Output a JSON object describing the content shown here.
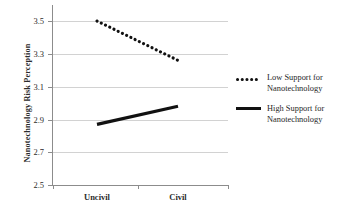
{
  "chart_data": {
    "type": "line",
    "title": "",
    "xlabel": "",
    "ylabel": "Nanotechnology Risk Perception",
    "categories": [
      "Uncivil",
      "Civil"
    ],
    "ylim": [
      2.5,
      3.5
    ],
    "yticks": [
      "3.5",
      "3.3",
      "3.1",
      "2.9",
      "2.7",
      "2.5"
    ],
    "ytick_values": [
      3.5,
      3.3,
      3.1,
      2.9,
      2.7,
      2.5
    ],
    "grid": true,
    "legend_position": "right",
    "series": [
      {
        "name": "Low Support for Nanotechnology",
        "label_line1": "Low Support for",
        "label_line2": "Nanotechnology",
        "style": "dotted",
        "color": "#111111",
        "values": [
          3.5,
          3.26
        ]
      },
      {
        "name": "High Support for Nanotechnology",
        "label_line1": "High Support for",
        "label_line2": "Nanotechnology",
        "style": "solid",
        "color": "#111111",
        "values": [
          2.87,
          2.98
        ]
      }
    ]
  },
  "axis": {
    "y_title": "Nanotechnology Risk Perception",
    "y_labels": [
      "3.5",
      "3.3",
      "3.1",
      "2.9",
      "2.7",
      "2.5"
    ],
    "x_labels": [
      "Uncivil",
      "Civil"
    ]
  },
  "legend": {
    "entries": [
      {
        "line1": "Low Support for",
        "line2": "Nanotechnology",
        "marker": "dotted-line-icon"
      },
      {
        "line1": "High Support for",
        "line2": "Nanotechnology",
        "marker": "solid-line-icon"
      }
    ]
  }
}
